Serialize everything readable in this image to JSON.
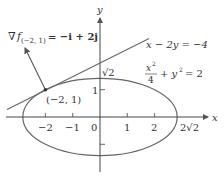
{
  "axes": {
    "x_label": "x",
    "y_label": "y",
    "x_ticks": [
      "−2",
      "−1",
      "0",
      "1",
      "2",
      "2√2"
    ],
    "y_ticks": [
      "1",
      "√2"
    ]
  },
  "gradient": {
    "nabla": "∇",
    "f": "f",
    "subscript": "(−2, 1)",
    "rhs": "= −i + 2j"
  },
  "tangent_line": {
    "equation": "x − 2y = −4"
  },
  "ellipse": {
    "numerator": "x",
    "exp": "2",
    "denominator": "4",
    "rest": "+ y",
    "exp2": "2",
    "rhs": "= 2"
  },
  "point": {
    "label": "(−2, 1)"
  },
  "colors": {
    "curve": "#666666",
    "axis": "#444444",
    "text": "#333333"
  }
}
